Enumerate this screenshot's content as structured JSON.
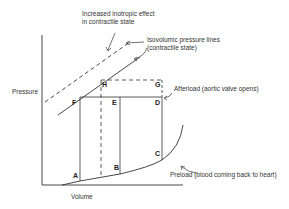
{
  "diagram": {
    "axes": {
      "y_label": "Pressure",
      "x_label": "Volume"
    },
    "annotations": {
      "inotropic": [
        "Increased inotropic effect",
        "in contractile state"
      ],
      "isovolumic": [
        "Isovolumic pressure lines",
        "(contractile state)"
      ],
      "afterload": "Afterload (aortic valve opens)",
      "preload": "Preload (blood coming back to heart)"
    },
    "points": {
      "A": "A",
      "B": "B",
      "C": "C",
      "D": "D",
      "E": "E",
      "F": "F",
      "G": "G",
      "H": "H"
    }
  }
}
